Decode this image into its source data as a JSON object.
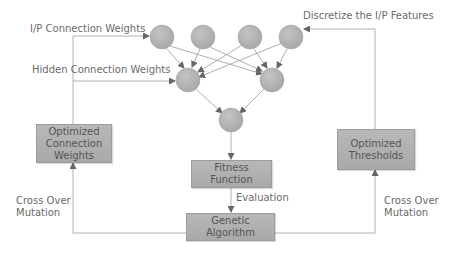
{
  "labels": {
    "ip_connection_weights": "I/P Connection Weights",
    "hidden_connection_weights": "Hidden Connection Weights",
    "discretize": "Discretize the I/P Features",
    "evaluation": "Evaluation",
    "cross_over_left_1": "Cross Over",
    "cross_over_left_2": "Mutation",
    "cross_over_right_1": "Cross Over",
    "cross_over_right_2": "Mutation"
  },
  "boxes": {
    "optimized_weights": {
      "line1": "Optimized",
      "line2": "Connection",
      "line3": "Weights"
    },
    "fitness": {
      "line1": "Fitness",
      "line2": "Function"
    },
    "genetic": {
      "line1": "Genetic",
      "line2": "Algorithm"
    },
    "thresholds": {
      "line1": "Optimized",
      "line2": "Thresholds"
    }
  },
  "network": {
    "input_nodes": 4,
    "hidden_nodes": 2,
    "output_nodes": 1
  },
  "colors": {
    "node": "#b5b5b5",
    "box": "#b0b0b0",
    "line": "#9a9a9a",
    "arrow": "#666666",
    "text": "#6a6a6a"
  }
}
